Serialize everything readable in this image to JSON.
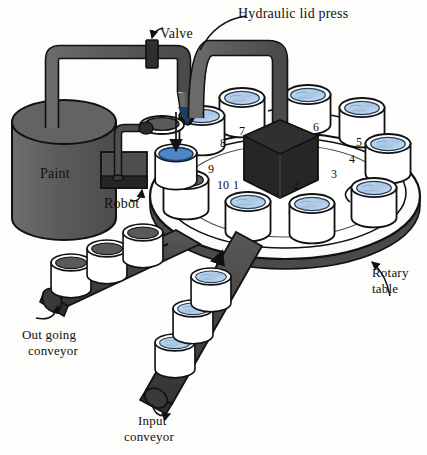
{
  "diagram": {
    "type": "process-schematic",
    "labels": {
      "paint_tank": "Paint",
      "valve": "Valve",
      "robot": "Robot",
      "hydraulic_lid_press": "Hydraulic lid press",
      "rotary_table_line1": "Rotary",
      "rotary_table_line2": "table",
      "outgoing_conveyor_line1": "Out going",
      "outgoing_conveyor_line2": "conveyor",
      "input_conveyor_line1": "Input",
      "input_conveyor_line2": "conveyor"
    },
    "stations": [
      {
        "number": "1",
        "x": 236,
        "y": 186
      },
      {
        "number": "2",
        "x": 296,
        "y": 186
      },
      {
        "number": "3",
        "x": 334,
        "y": 175
      },
      {
        "number": "4",
        "x": 352,
        "y": 160
      },
      {
        "number": "5",
        "x": 359,
        "y": 143
      },
      {
        "number": "6",
        "x": 316,
        "y": 128
      },
      {
        "number": "7",
        "x": 242,
        "y": 132
      },
      {
        "number": "8",
        "x": 223,
        "y": 144
      },
      {
        "number": "9",
        "x": 211,
        "y": 170
      },
      {
        "number": "10",
        "x": 223,
        "y": 186
      }
    ],
    "colors": {
      "machinery_gray": "#5b5b5b",
      "press_black": "#2a2a2a",
      "paint_blue": "#adc9e6",
      "paint_blue_deep": "#4b87c8",
      "lid_gray": "#5a5a5a",
      "can_white": "#ffffff",
      "outline": "#1a1a1a",
      "table_white": "#fbfbfb",
      "background": "#fdfdfb"
    },
    "elements": {
      "paint_tank": "vertical cylinder reservoir, dark gray",
      "supply_pipe": "gray pipe from tank top running right then down to fill nozzle",
      "valve": "dark block on horizontal supply pipe",
      "fill_arrow": "vertical down arrow into can at station 9",
      "robot": "dark box with vertical post and arm holding a lid",
      "press_column": "gray gantry arm descending to black cube press",
      "rotary_table": "large white elliptical turntable ring",
      "input_conveyor": "dark belt entering from lower right carrying filled cans",
      "outgoing_conveyor": "dark belt exiting to lower left carrying lidded cans"
    }
  }
}
